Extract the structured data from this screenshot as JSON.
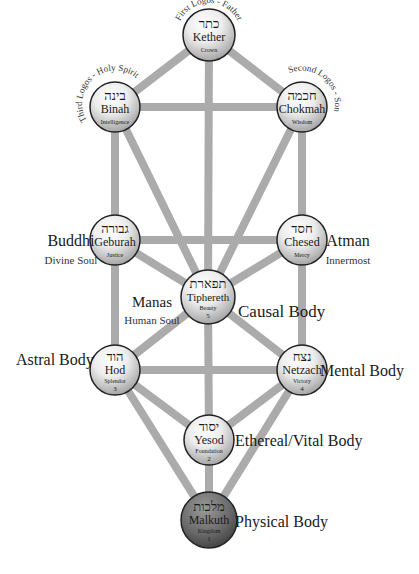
{
  "diagram": {
    "colors": {
      "path": "#ababab",
      "node_fill_light": "#ffffff",
      "node_fill_dark": "#a9a9a9",
      "node_stroke": "#222222",
      "malkuth_fill_light": "#9a9a9a",
      "malkuth_fill_dark": "#4a4a4a"
    },
    "nodes": [
      {
        "id": "kether",
        "hebrew": "כתר",
        "name": "Kether",
        "meaning": "Crown",
        "number": "",
        "x": 209,
        "y": 35,
        "r": 26
      },
      {
        "id": "binah",
        "hebrew": "בינה",
        "name": "Binah",
        "meaning": "Intelligence",
        "number": "",
        "x": 115,
        "y": 107,
        "r": 25
      },
      {
        "id": "chokmah",
        "hebrew": "חכמה",
        "name": "Chokmah",
        "meaning": "Wisdom",
        "number": "",
        "x": 302,
        "y": 107,
        "r": 25
      },
      {
        "id": "geburah",
        "hebrew": "גבורה",
        "name": "Geburah",
        "meaning": "Justice",
        "number": "",
        "x": 115,
        "y": 240,
        "r": 25
      },
      {
        "id": "chesed",
        "hebrew": "חסד",
        "name": "Chesed",
        "meaning": "Mercy",
        "number": "",
        "x": 302,
        "y": 240,
        "r": 25
      },
      {
        "id": "tiphereth",
        "hebrew": "תפארת",
        "name": "Tiphereth",
        "meaning": "Beauty",
        "number": "5",
        "x": 208,
        "y": 297,
        "r": 27
      },
      {
        "id": "hod",
        "hebrew": "הוד",
        "name": "Hod",
        "meaning": "Splendor",
        "number": "3",
        "x": 115,
        "y": 370,
        "r": 25
      },
      {
        "id": "netzach",
        "hebrew": "נצח",
        "name": "Netzach",
        "meaning": "Victory",
        "number": "4",
        "x": 302,
        "y": 370,
        "r": 25
      },
      {
        "id": "yesod",
        "hebrew": "יסוד",
        "name": "Yesod",
        "meaning": "Foundation",
        "number": "2",
        "x": 209,
        "y": 440,
        "r": 25
      },
      {
        "id": "malkuth",
        "hebrew": "מלכות",
        "name": "Malkuth",
        "meaning": "Kingdom",
        "number": "1",
        "x": 209,
        "y": 520,
        "r": 28
      }
    ],
    "paths": [
      [
        "kether",
        "binah"
      ],
      [
        "kether",
        "chokmah"
      ],
      [
        "kether",
        "tiphereth"
      ],
      [
        "binah",
        "chokmah"
      ],
      [
        "binah",
        "geburah"
      ],
      [
        "binah",
        "tiphereth"
      ],
      [
        "chokmah",
        "chesed"
      ],
      [
        "chokmah",
        "tiphereth"
      ],
      [
        "geburah",
        "chesed"
      ],
      [
        "geburah",
        "tiphereth"
      ],
      [
        "geburah",
        "hod"
      ],
      [
        "chesed",
        "tiphereth"
      ],
      [
        "chesed",
        "netzach"
      ],
      [
        "tiphereth",
        "hod"
      ],
      [
        "tiphereth",
        "netzach"
      ],
      [
        "tiphereth",
        "yesod"
      ],
      [
        "hod",
        "netzach"
      ],
      [
        "hod",
        "yesod"
      ],
      [
        "hod",
        "malkuth"
      ],
      [
        "netzach",
        "yesod"
      ],
      [
        "netzach",
        "malkuth"
      ],
      [
        "yesod",
        "malkuth"
      ]
    ],
    "arc_labels": {
      "kether": "First Logos - Father",
      "binah": "Third Logos - Holy Spirit",
      "chokmah": "Second Logos - Son"
    },
    "side_labels": {
      "buddhi": {
        "title": "Buddhi",
        "subtitle": "Divine Soul"
      },
      "atman": {
        "title": "Atman",
        "subtitle": "Innermost"
      },
      "manas": {
        "title": "Manas",
        "subtitle": "Human Soul"
      },
      "causal": {
        "title": "Causal Body"
      },
      "astral": {
        "title": "Astral Body"
      },
      "mental": {
        "title": "Mental Body"
      },
      "ethereal": {
        "title": "Ethereal/Vital Body"
      },
      "physical": {
        "title": "Physical Body"
      }
    }
  }
}
